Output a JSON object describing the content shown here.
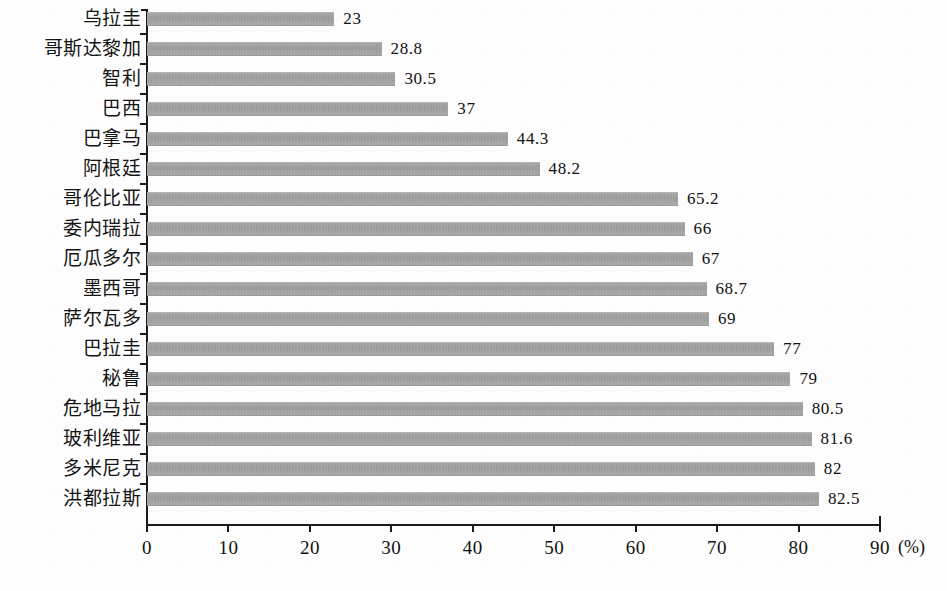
{
  "chart_data": {
    "type": "bar",
    "orientation": "horizontal",
    "title": "",
    "subtitle": "",
    "xlabel": "(%)",
    "ylabel": "",
    "xlim": [
      0,
      90
    ],
    "grid": false,
    "legend": null,
    "unit": "(%)",
    "bar_color": "#a3a3a3",
    "axis_color": "#1a1a1a",
    "text_color": "#111111",
    "background": "#fdfdfd",
    "xticks": [
      0,
      10,
      20,
      30,
      40,
      50,
      60,
      70,
      80,
      90
    ],
    "xtick_labels": [
      "0",
      "10",
      "20",
      "30",
      "40",
      "50",
      "60",
      "70",
      "80",
      "90"
    ],
    "categories": [
      "乌拉圭",
      "哥斯达黎加",
      "智利",
      "巴西",
      "巴拿马",
      "阿根廷",
      "哥伦比亚",
      "委内瑞拉",
      "厄瓜多尔",
      "墨西哥",
      "萨尔瓦多",
      "巴拉圭",
      "秘鲁",
      "危地马拉",
      "玻利维亚",
      "多米尼克",
      "洪都拉斯"
    ],
    "values": [
      23,
      28.8,
      30.5,
      37,
      44.3,
      48.2,
      65.2,
      66,
      67,
      68.7,
      69,
      77,
      79,
      80.5,
      81.6,
      82,
      82.5
    ],
    "value_labels": [
      "23",
      "28.8",
      "30.5",
      "37",
      "44.3",
      "48.2",
      "65.2",
      "66",
      "67",
      "68.7",
      "69",
      "77",
      "79",
      "80.5",
      "81.6",
      "82",
      "82.5"
    ]
  }
}
